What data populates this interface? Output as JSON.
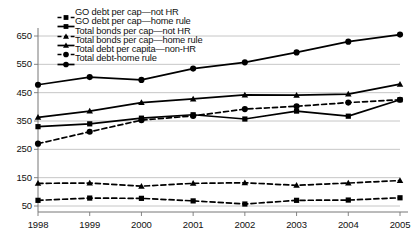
{
  "chart_data": {
    "type": "line",
    "title": "",
    "xlabel": "",
    "ylabel": "",
    "categories": [
      "1998",
      "1999",
      "2000",
      "2001",
      "2002",
      "2003",
      "2004",
      "2005"
    ],
    "x": [
      1998,
      1999,
      2000,
      2001,
      2002,
      2003,
      2004,
      2005
    ],
    "ylim": [
      50,
      650
    ],
    "yticks": [
      50,
      150,
      250,
      350,
      450,
      550,
      650
    ],
    "ytick_labels": [
      "50",
      "150",
      "250",
      "350",
      "450",
      "550",
      "650"
    ],
    "grid": true,
    "grid_axis": "y",
    "legend_position": "top-left",
    "series": [
      {
        "name": "GO debt per cap—not HR",
        "marker": "square",
        "linestyle": "dashed",
        "color": "#000000",
        "values": [
          70,
          78,
          77,
          68,
          57,
          70,
          71,
          79
        ]
      },
      {
        "name": "GO debt per cap—home rule",
        "marker": "square",
        "linestyle": "solid",
        "color": "#000000",
        "values": [
          330,
          340,
          360,
          372,
          357,
          385,
          367,
          425
        ]
      },
      {
        "name": "Total bonds per cap—not HR",
        "marker": "triangle",
        "linestyle": "dashed",
        "color": "#000000",
        "values": [
          130,
          131,
          120,
          130,
          132,
          123,
          131,
          140
        ]
      },
      {
        "name": "Total bonds per cap—home rule",
        "marker": "triangle",
        "linestyle": "solid",
        "color": "#000000",
        "values": [
          363,
          385,
          415,
          428,
          442,
          441,
          445,
          480
        ]
      },
      {
        "name": "Total debt per capita—non-HR",
        "marker": "circle",
        "linestyle": "dashed",
        "color": "#000000",
        "values": [
          270,
          312,
          353,
          368,
          392,
          402,
          415,
          425
        ]
      },
      {
        "name": "Total debt-home rule",
        "marker": "circle",
        "linestyle": "solid",
        "color": "#000000",
        "values": [
          478,
          505,
          495,
          535,
          557,
          592,
          630,
          655
        ]
      }
    ]
  },
  "colors": {
    "ink": "#000000",
    "grid": "#b8b8b8",
    "axis": "#777777",
    "background": "#ffffff"
  }
}
